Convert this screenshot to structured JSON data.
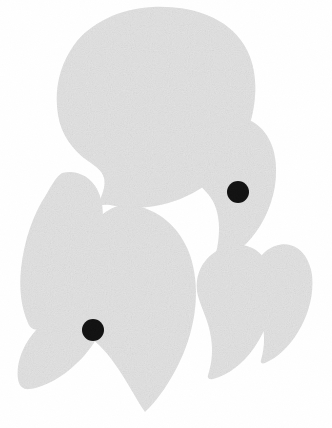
{
  "artwork": {
    "title": "Abstract speech-bubble and petal composition",
    "canvas": {
      "width": 332,
      "height": 428,
      "background_color": "#ffffff"
    },
    "palette": {
      "petal_fill": "#e3e3e3",
      "petal_fill_light": "#e8e8e8",
      "dot_fill": "#111111",
      "background": "#ffffff"
    },
    "shapes": [
      {
        "name": "speech-bubble-large",
        "kind": "speech-bubble",
        "fill": "#e3e3e3",
        "bounds": {
          "x": 58,
          "y": 7,
          "width": 196,
          "height": 205
        },
        "tail_tip": {
          "x": 96,
          "y": 208
        }
      },
      {
        "name": "petal-upper-right",
        "kind": "teardrop",
        "fill": "#e3e3e3",
        "bounds": {
          "x": 186,
          "y": 117,
          "width": 90,
          "height": 148
        },
        "tip": {
          "x": 214,
          "y": 262
        }
      },
      {
        "name": "petal-far-right",
        "kind": "teardrop",
        "fill": "#e3e3e3",
        "bounds": {
          "x": 252,
          "y": 245,
          "width": 60,
          "height": 120
        },
        "tip": {
          "x": 262,
          "y": 362
        }
      },
      {
        "name": "petal-right-lower",
        "kind": "teardrop",
        "fill": "#e3e3e3",
        "bounds": {
          "x": 196,
          "y": 246,
          "width": 78,
          "height": 134
        },
        "tip": {
          "x": 208,
          "y": 378
        }
      },
      {
        "name": "petal-center-large",
        "kind": "teardrop",
        "fill": "#e3e3e3",
        "bounds": {
          "x": 62,
          "y": 205,
          "width": 135,
          "height": 210
        },
        "tip": {
          "x": 148,
          "y": 412
        }
      },
      {
        "name": "petal-left-upper",
        "kind": "teardrop",
        "fill": "#e3e3e3",
        "bounds": {
          "x": 19,
          "y": 170,
          "width": 84,
          "height": 160
        },
        "tip": {
          "x": 98,
          "y": 328
        }
      },
      {
        "name": "petal-left-lower",
        "kind": "teardrop",
        "fill": "#e3e3e3",
        "bounds": {
          "x": 18,
          "y": 292,
          "width": 92,
          "height": 98
        },
        "tip": {
          "x": 100,
          "y": 330
        }
      }
    ],
    "dots": [
      {
        "name": "dot-upper",
        "center_x": 238,
        "center_y": 192,
        "radius": 11,
        "fill": "#111111"
      },
      {
        "name": "dot-lower",
        "center_x": 93,
        "center_y": 330,
        "radius": 11,
        "fill": "#111111"
      }
    ]
  }
}
